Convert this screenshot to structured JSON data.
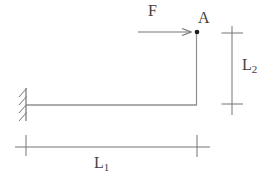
{
  "diagram": {
    "force_label": "F",
    "point_label": "A",
    "dim_horizontal": {
      "base": "L",
      "sub": "1"
    },
    "dim_vertical": {
      "base": "L",
      "sub": "2"
    },
    "colors": {
      "line": "#8f8f8f",
      "tick": "#757575",
      "text": "#3f3f3f",
      "point": "#1c1c1c",
      "background": "#ffffff"
    }
  }
}
